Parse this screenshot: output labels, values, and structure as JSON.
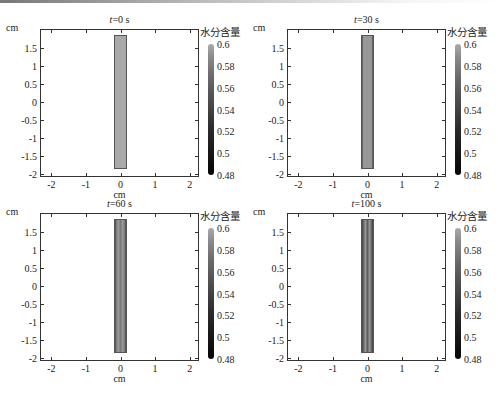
{
  "chart_data": [
    {
      "type": "heatmap",
      "title": "t=0 s",
      "title_var": "t",
      "title_value": "=0 s",
      "xlabel": "cm",
      "ylabel": "cm",
      "xlim": [
        -2.3,
        2.3
      ],
      "ylim": [
        -2.1,
        2.0
      ],
      "xticks": [
        "-2",
        "-1",
        "0",
        "1",
        "2"
      ],
      "yticks": [
        "1.5",
        "1",
        "0.5",
        "0",
        "-0.5",
        "-1",
        "-1.5",
        "-2"
      ],
      "colorbar": {
        "label": "水分含量",
        "ticks": [
          "0.6",
          "0.58",
          "0.56",
          "0.54",
          "0.52",
          "0.5",
          "0.48"
        ],
        "range": [
          0.48,
          0.6
        ]
      },
      "sample": {
        "x_range": [
          -0.2,
          0.2
        ],
        "y_range": [
          -1.85,
          1.85
        ],
        "moisture": 0.6,
        "fill": "#a9a9a9"
      }
    },
    {
      "type": "heatmap",
      "title": "t=30 s",
      "title_var": "t",
      "title_value": "=30 s",
      "xlabel": "cm",
      "ylabel": "cm",
      "xlim": [
        -2.3,
        2.3
      ],
      "ylim": [
        -2.1,
        2.0
      ],
      "xticks": [
        "-2",
        "-1",
        "0",
        "1",
        "2"
      ],
      "yticks": [
        "1.5",
        "1",
        "0.5",
        "0",
        "-0.5",
        "-1",
        "-1.5",
        "-2"
      ],
      "colorbar": {
        "label": "水分含量",
        "ticks": [
          "0.6",
          "0.58",
          "0.56",
          "0.54",
          "0.52",
          "0.5",
          "0.48"
        ],
        "range": [
          0.48,
          0.6
        ]
      },
      "sample": {
        "x_range": [
          -0.2,
          0.2
        ],
        "y_range": [
          -1.85,
          1.85
        ],
        "moisture": 0.59,
        "fill": "#969696"
      }
    },
    {
      "type": "heatmap",
      "title": "t=60 s",
      "title_var": "t",
      "title_value": "=60 s",
      "xlabel": "cm",
      "ylabel": "cm",
      "xlim": [
        -2.3,
        2.3
      ],
      "ylim": [
        -2.1,
        2.0
      ],
      "xticks": [
        "-2",
        "-1",
        "0",
        "1",
        "2"
      ],
      "yticks": [
        "1.5",
        "1",
        "0.5",
        "0",
        "-0.5",
        "-1",
        "-1.5",
        "-2"
      ],
      "colorbar": {
        "label": "水分含量",
        "ticks": [
          "0.6",
          "0.58",
          "0.56",
          "0.54",
          "0.52",
          "0.5",
          "0.48"
        ],
        "range": [
          0.48,
          0.6
        ]
      },
      "sample": {
        "x_range": [
          -0.2,
          0.2
        ],
        "y_range": [
          -1.85,
          1.85
        ],
        "moisture": 0.575,
        "fill": "#7a7a7a"
      }
    },
    {
      "type": "heatmap",
      "title": "t=100 s",
      "title_var": "t",
      "title_value": "=100 s",
      "xlabel": "cm",
      "ylabel": "cm",
      "xlim": [
        -2.3,
        2.3
      ],
      "ylim": [
        -2.1,
        2.0
      ],
      "xticks": [
        "-2",
        "-1",
        "0",
        "1",
        "2"
      ],
      "yticks": [
        "1.5",
        "1",
        "0.5",
        "0",
        "-0.5",
        "-1",
        "-1.5",
        "-2"
      ],
      "colorbar": {
        "label": "水分含量",
        "ticks": [
          "0.6",
          "0.58",
          "0.56",
          "0.54",
          "0.52",
          "0.5",
          "0.48"
        ],
        "range": [
          0.48,
          0.6
        ]
      },
      "sample": {
        "x_range": [
          -0.2,
          0.2
        ],
        "y_range": [
          -1.85,
          1.85
        ],
        "moisture": 0.56,
        "fill": "#5e5e5e"
      }
    }
  ]
}
